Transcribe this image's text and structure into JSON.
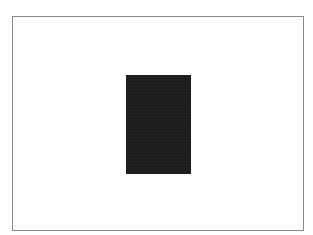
{
  "canvas": {
    "background_color": "#ffffff"
  },
  "frame": {
    "border_color": "#8a8a8a",
    "x": 12,
    "y": 16,
    "width": 292,
    "height": 215
  },
  "dark_rectangle": {
    "fill_color": "#1e1e1e",
    "x": 126,
    "y": 75,
    "width": 65,
    "height": 99
  }
}
